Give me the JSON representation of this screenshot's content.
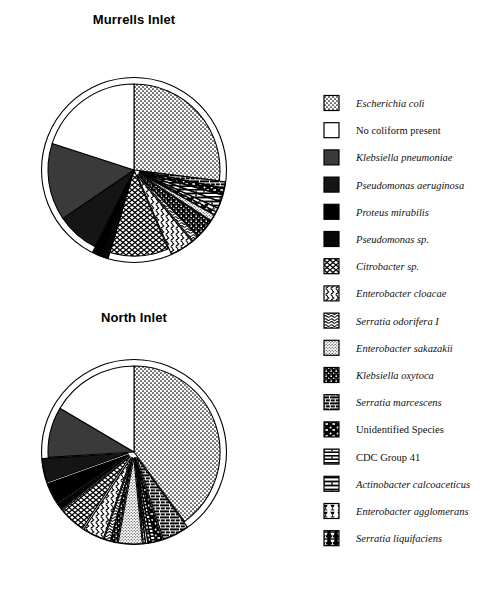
{
  "figure": {
    "background": "#ffffff",
    "outline_color": "#000000"
  },
  "charts": [
    {
      "title": "Murrells Inlet",
      "title_x": 134,
      "title_y": 24,
      "cx": 134,
      "cy": 170,
      "r": 86
    },
    {
      "title": "North Inlet",
      "title_x": 134,
      "title_y": 322,
      "cx": 134,
      "cy": 452,
      "r": 86
    }
  ],
  "legend": {
    "x_swatch": 324,
    "x_label": 356,
    "y_start": 103,
    "y_step": 27.2,
    "swatch_size": 15,
    "items": [
      {
        "label": "Escherichia coli",
        "italic": true,
        "pattern": "stipple-coarse"
      },
      {
        "label": "No coliform present",
        "italic": false,
        "pattern": "white"
      },
      {
        "label": "Klebsiella pneumoniae",
        "italic": true,
        "pattern": "gray-dark"
      },
      {
        "label": "Pseudomonas aeruginosa",
        "italic": true,
        "pattern": "near-black"
      },
      {
        "label": "Proteus mirabilis",
        "italic": true,
        "pattern": "black"
      },
      {
        "label": "Pseudomonas sp.",
        "italic": true,
        "pattern": "black2"
      },
      {
        "label": "Citrobacter sp.",
        "italic": true,
        "pattern": "zigzag-bold"
      },
      {
        "label": "Enterobacter cloacae",
        "italic": true,
        "pattern": "wave-s"
      },
      {
        "label": "Serratia odorifera I",
        "italic": true,
        "pattern": "wave-double"
      },
      {
        "label": "Enterobacter  sakazakii",
        "italic": true,
        "pattern": "stipple-fine"
      },
      {
        "label": "Klebsiella oxytoca",
        "italic": true,
        "pattern": "dot-cluster"
      },
      {
        "label": "Serratia marcescens",
        "italic": true,
        "pattern": "brick"
      },
      {
        "label": "Unidentified Species",
        "italic": false,
        "pattern": "brick-dot"
      },
      {
        "label": "CDC Group 41",
        "italic": false,
        "pattern": "hbar"
      },
      {
        "label": "Actinobacter calcoaceticus",
        "italic": true,
        "pattern": "hbar-split"
      },
      {
        "label": "Enterobacter agglomerans",
        "italic": true,
        "pattern": "goblet-light"
      },
      {
        "label": "Serratia liquifaciens",
        "italic": true,
        "pattern": "goblet-dark"
      }
    ]
  },
  "chart_data": {
    "type": "pie",
    "legend_position": "right",
    "categories": [
      "Escherichia coli",
      "No coliform present",
      "Klebsiella pneumoniae",
      "Pseudomonas aeruginosa",
      "Proteus mirabilis",
      "Pseudomonas sp.",
      "Citrobacter sp.",
      "Enterobacter cloacae",
      "Serratia odorifera I",
      "Enterobacter  sakazakii",
      "Klebsiella oxytoca",
      "Serratia marcescens",
      "Unidentified Species",
      "CDC Group 41",
      "Actinobacter calcoaceticus",
      "Enterobacter agglomerans",
      "Serratia liquifaciens"
    ],
    "series": [
      {
        "name": "Murrells Inlet",
        "units": "percent",
        "values": [
          27.0,
          20.0,
          14.5,
          8.0,
          2.0,
          1.0,
          11.0,
          4.5,
          1.2,
          1.2,
          3.5,
          1.2,
          1.2,
          1.2,
          1.2,
          0.7,
          0.6
        ]
      },
      {
        "name": "North Inlet",
        "units": "percent",
        "values": [
          40.0,
          16.5,
          9.5,
          4.5,
          4.0,
          1.2,
          5.0,
          4.0,
          1.2,
          4.5,
          1.2,
          5.0,
          1.2,
          0.8,
          0.6,
          0.4,
          0.4
        ]
      }
    ]
  }
}
